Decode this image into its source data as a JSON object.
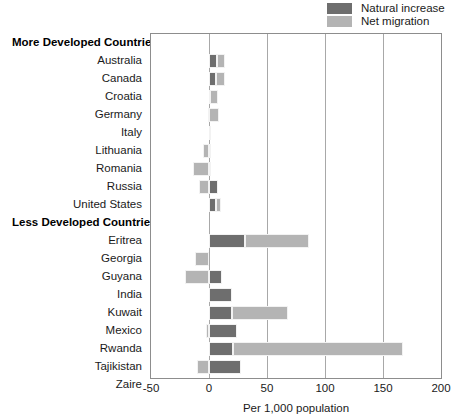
{
  "legend": {
    "items": [
      {
        "label": "Natural increase",
        "key": "nat",
        "color": "#6e6e6e",
        "icon": "legend-swatch-icon"
      },
      {
        "label": "Net migration",
        "key": "net",
        "color": "#b4b4b4",
        "icon": "legend-swatch-icon"
      }
    ]
  },
  "axis": {
    "x_title": "Per 1,000 population",
    "ticks": [
      "-50",
      "0",
      "50",
      "100",
      "150",
      "200"
    ],
    "tick_values": [
      -50,
      0,
      50,
      100,
      150,
      200
    ],
    "xmin": -50,
    "xmax": 200
  },
  "groups": [
    {
      "label": "More Developed Countries"
    },
    {
      "label": "Less Developed Countries"
    }
  ],
  "chart_data": {
    "type": "bar",
    "orientation": "horizontal",
    "stacked": true,
    "title": "",
    "xlabel": "Per 1,000 population",
    "ylabel": "",
    "xlim": [
      -50,
      200
    ],
    "xticks": [
      -50,
      0,
      50,
      100,
      150,
      200
    ],
    "grid": "vertical",
    "legend_position": "top-right",
    "series": [
      {
        "name": "Natural increase",
        "color": "#6e6e6e"
      },
      {
        "name": "Net migration",
        "color": "#b4b4b4"
      }
    ],
    "groups": [
      {
        "name": "More Developed Countries",
        "rows": [
          {
            "category": "Australia",
            "natural_increase": 7,
            "net_migration": 7
          },
          {
            "category": "Canada",
            "natural_increase": 6,
            "net_migration": 8
          },
          {
            "category": "Croatia",
            "natural_increase": 1,
            "net_migration": 7
          },
          {
            "category": "Germany",
            "natural_increase": -1,
            "net_migration": 9
          },
          {
            "category": "Italy",
            "natural_increase": 0,
            "net_migration": 1
          },
          {
            "category": "Lithuania",
            "natural_increase": 1,
            "net_migration": -5
          },
          {
            "category": "Romania",
            "natural_increase": 1,
            "net_migration": -14
          },
          {
            "category": "Russia",
            "natural_increase": 8,
            "net_migration": -9
          },
          {
            "category": "United States",
            "natural_increase": 6,
            "net_migration": 4
          }
        ]
      },
      {
        "name": "Less Developed Countries",
        "rows": [
          {
            "category": "Eritrea",
            "natural_increase": 31,
            "net_migration": 55
          },
          {
            "category": "Georgia",
            "natural_increase": 0,
            "net_migration": -12
          },
          {
            "category": "Guyana",
            "natural_increase": 11,
            "net_migration": -21
          },
          {
            "category": "India",
            "natural_increase": 20,
            "net_migration": 0
          },
          {
            "category": "Kuwait",
            "natural_increase": 20,
            "net_migration": 48
          },
          {
            "category": "Mexico",
            "natural_increase": 24,
            "net_migration": -3
          },
          {
            "category": "Rwanda",
            "natural_increase": 21,
            "net_migration": 146
          },
          {
            "category": "Tajikistan",
            "natural_increase": 28,
            "net_migration": -10
          },
          {
            "category": "Zaire",
            "natural_increase": 33,
            "net_migration": -15
          }
        ]
      }
    ]
  }
}
